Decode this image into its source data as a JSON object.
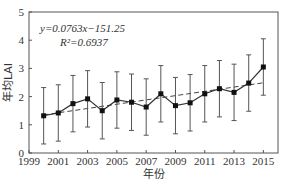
{
  "chart_data": {
    "type": "line",
    "title": "",
    "xlabel": "年份",
    "ylabel": "年均LAI",
    "xlim": [
      1999,
      2016
    ],
    "ylim": [
      0,
      5
    ],
    "x_ticks": [
      1999,
      2001,
      2003,
      2005,
      2007,
      2009,
      2011,
      2013,
      2015
    ],
    "y_ticks": [
      0,
      1,
      2,
      3,
      4,
      5
    ],
    "grid": false,
    "legend": null,
    "annotations": [
      "y=0.0763x−151.25",
      "R²=0.6937"
    ],
    "x": [
      2000,
      2001,
      2002,
      2003,
      2004,
      2005,
      2006,
      2007,
      2008,
      2009,
      2010,
      2011,
      2012,
      2013,
      2014,
      2015
    ],
    "series": [
      {
        "name": "年均LAI",
        "style": "solid line with square markers",
        "values": [
          1.32,
          1.42,
          1.75,
          1.92,
          1.5,
          1.88,
          1.8,
          1.63,
          2.1,
          1.68,
          1.78,
          2.1,
          2.28,
          2.15,
          2.48,
          3.05
        ],
        "error": [
          1.0,
          1.0,
          1.0,
          1.0,
          1.0,
          1.0,
          1.0,
          1.0,
          1.0,
          1.0,
          1.0,
          1.0,
          1.0,
          1.0,
          1.0,
          1.0
        ]
      },
      {
        "name": "trend",
        "style": "dashed",
        "equation": "y=0.0763x-151.25",
        "r2": 0.6937,
        "x": [
          2000,
          2015
        ],
        "values": [
          1.35,
          2.49
        ]
      }
    ]
  },
  "labels": {
    "equation": "y=0.0763x−151.25",
    "r2": "R²=0.6937",
    "xlabel": "年份",
    "ylabel": "年均LAI"
  }
}
